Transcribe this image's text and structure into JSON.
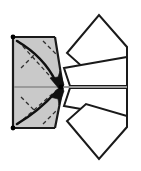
{
  "diagram": {
    "title": "Origami fold step diagram",
    "type": "origami-instruction",
    "canvas": {
      "width": 141,
      "height": 171
    },
    "colors": {
      "paper_shaded": "#c9c9c9",
      "paper_white": "#ffffff",
      "stroke": "#1a1a1a",
      "crease_dashed": "#3a3a3a",
      "axis_line": "#9a9a9a",
      "dot": "#000000",
      "background": "#ffffff"
    },
    "stroke_widths": {
      "outline": 2.0,
      "crease": 1.2,
      "arrow": 2.2,
      "axis": 1.6
    },
    "shaded_panel": {
      "name": "shaded-square-panel",
      "points": "13,37 55,37 62,87 55,128 13,128",
      "fill": "#c9c9c9"
    },
    "shaded_point_triangle": {
      "name": "shaded-point",
      "points": "55,37 62,87 55,128"
    },
    "panel_outline_segments": [
      {
        "name": "panel-left-edge",
        "x1": 13,
        "y1": 37,
        "x2": 13,
        "y2": 128
      },
      {
        "name": "panel-top-edge",
        "x1": 13,
        "y1": 37,
        "x2": 55,
        "y2": 37
      },
      {
        "name": "panel-bottom-edge",
        "x1": 13,
        "y1": 128,
        "x2": 55,
        "y2": 128
      },
      {
        "name": "panel-upper-diagonal",
        "x1": 55,
        "y1": 37,
        "x2": 63,
        "y2": 87
      },
      {
        "name": "panel-lower-diagonal",
        "x1": 63,
        "y1": 87,
        "x2": 55,
        "y2": 128
      }
    ],
    "creases": [
      {
        "name": "crease-top-right-diagonal",
        "x1": 17,
        "y1": 40,
        "x2": 57,
        "y2": 86
      },
      {
        "name": "crease-bottom-right-diagonal",
        "x1": 17,
        "y1": 125,
        "x2": 57,
        "y2": 88
      },
      {
        "name": "crease-upper-short",
        "x1": 44,
        "y1": 41,
        "x2": 56,
        "y2": 53
      },
      {
        "name": "crease-lower-short",
        "x1": 44,
        "y1": 124,
        "x2": 56,
        "y2": 112
      },
      {
        "name": "crease-inner-upper",
        "x1": 22,
        "y1": 66,
        "x2": 33,
        "y2": 55
      },
      {
        "name": "crease-inner-lower",
        "x1": 22,
        "y1": 99,
        "x2": 33,
        "y2": 110
      }
    ],
    "arrows": [
      {
        "name": "fold-arrow-upper",
        "path": "M 17,41 C 35,52 48,64 58,85",
        "direction": "down-right"
      },
      {
        "name": "fold-arrow-lower",
        "path": "M 17,124 C 35,113 48,101 58,89",
        "direction": "up-right"
      }
    ],
    "center_axis_line": {
      "name": "center-axis-line",
      "x1": 14,
      "y1": 87,
      "x2": 127,
      "y2": 87
    },
    "center_point": {
      "name": "center-point-dot",
      "cx": 61,
      "cy": 87,
      "r": 2.2
    },
    "reference_dots": [
      {
        "name": "corner-dot-top-left",
        "cx": 13,
        "cy": 37,
        "r": 2.2
      },
      {
        "name": "corner-dot-bottom-left",
        "cx": 13,
        "cy": 128,
        "r": 2.2
      }
    ],
    "flaps": [
      {
        "name": "flap-upper-outer",
        "label": "upper outer flap",
        "points": "67,53 99,15 127,47 127,58 86,70",
        "fill": "#ffffff"
      },
      {
        "name": "flap-upper-inner",
        "label": "upper inner flap",
        "points": "64,68 127,57 127,85 71,85",
        "fill": "#ffffff"
      },
      {
        "name": "flap-lower-inner",
        "label": "lower inner flap",
        "points": "64,97 127,108 127,80 71,80",
        "fill": "#ffffff"
      },
      {
        "name": "flap-lower-outer",
        "label": "lower outer flap",
        "points": "67,112 99,150 127,118 127,107 86,95",
        "fill": "#ffffff"
      }
    ],
    "flap_edges": [
      {
        "name": "flap-right-vertical-edge",
        "x1": 127,
        "y1": 47,
        "x2": 127,
        "y2": 118
      }
    ]
  }
}
